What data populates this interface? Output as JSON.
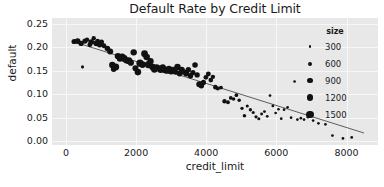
{
  "chart_data": {
    "type": "scatter",
    "title": "Default Rate by Credit Limit",
    "xlabel": "credit_limit",
    "ylabel": "default",
    "xlim": [
      -400,
      8900
    ],
    "ylim": [
      -0.008,
      0.262
    ],
    "xticks": [
      "0",
      "2000",
      "4000",
      "6000",
      "8000"
    ],
    "xtick_values": [
      0,
      2000,
      4000,
      6000,
      8000
    ],
    "yticks": [
      "0.00",
      "0.05",
      "0.10",
      "0.15",
      "0.20",
      "0.25"
    ],
    "ytick_values": [
      0.0,
      0.05,
      0.1,
      0.15,
      0.2,
      0.25
    ],
    "grid": true,
    "grid_color": "#f7f7f7",
    "plot_background": "#e8e8e8",
    "marker_color": "#111111",
    "trendline_color": "#4d4d4d",
    "legend": {
      "title": "size",
      "position": "upper right inside",
      "entries": [
        {
          "label": "300",
          "value": 300,
          "radius_px": 1.4
        },
        {
          "label": "600",
          "value": 600,
          "radius_px": 2.0
        },
        {
          "label": "900",
          "value": 900,
          "radius_px": 2.6
        },
        {
          "label": "1200",
          "value": 1200,
          "radius_px": 3.2
        },
        {
          "label": "1500",
          "value": 1500,
          "radius_px": 3.8
        }
      ]
    },
    "trendline": {
      "x0": 300,
      "y0": 0.2095,
      "x1": 8500,
      "y1": 0.0175
    },
    "size_encoding": {
      "column": "size",
      "min": 300,
      "max": 1500
    },
    "points": [
      {
        "x": 230,
        "y": 0.212,
        "size": 900
      },
      {
        "x": 330,
        "y": 0.213,
        "size": 1050
      },
      {
        "x": 430,
        "y": 0.208,
        "size": 900
      },
      {
        "x": 470,
        "y": 0.158,
        "size": 400
      },
      {
        "x": 540,
        "y": 0.213,
        "size": 900
      },
      {
        "x": 600,
        "y": 0.216,
        "size": 700
      },
      {
        "x": 680,
        "y": 0.205,
        "size": 850
      },
      {
        "x": 720,
        "y": 0.211,
        "size": 1000
      },
      {
        "x": 790,
        "y": 0.219,
        "size": 700
      },
      {
        "x": 860,
        "y": 0.208,
        "size": 1000
      },
      {
        "x": 900,
        "y": 0.213,
        "size": 800
      },
      {
        "x": 960,
        "y": 0.205,
        "size": 1000
      },
      {
        "x": 1010,
        "y": 0.211,
        "size": 900
      },
      {
        "x": 1080,
        "y": 0.203,
        "size": 850
      },
      {
        "x": 1180,
        "y": 0.197,
        "size": 1000
      },
      {
        "x": 1260,
        "y": 0.191,
        "size": 1100
      },
      {
        "x": 1320,
        "y": 0.162,
        "size": 1200
      },
      {
        "x": 1360,
        "y": 0.153,
        "size": 1000
      },
      {
        "x": 1420,
        "y": 0.158,
        "size": 1300
      },
      {
        "x": 1480,
        "y": 0.181,
        "size": 1200
      },
      {
        "x": 1540,
        "y": 0.176,
        "size": 1250
      },
      {
        "x": 1600,
        "y": 0.179,
        "size": 1400
      },
      {
        "x": 1660,
        "y": 0.176,
        "size": 1300
      },
      {
        "x": 1720,
        "y": 0.172,
        "size": 1200
      },
      {
        "x": 1790,
        "y": 0.171,
        "size": 1350
      },
      {
        "x": 1850,
        "y": 0.167,
        "size": 1150
      },
      {
        "x": 1930,
        "y": 0.189,
        "size": 1200
      },
      {
        "x": 1980,
        "y": 0.155,
        "size": 1100
      },
      {
        "x": 2050,
        "y": 0.147,
        "size": 1250
      },
      {
        "x": 2110,
        "y": 0.166,
        "size": 1400
      },
      {
        "x": 2180,
        "y": 0.163,
        "size": 1300
      },
      {
        "x": 2240,
        "y": 0.186,
        "size": 1300
      },
      {
        "x": 2300,
        "y": 0.179,
        "size": 1250
      },
      {
        "x": 2350,
        "y": 0.163,
        "size": 1400
      },
      {
        "x": 2410,
        "y": 0.17,
        "size": 1200
      },
      {
        "x": 2470,
        "y": 0.158,
        "size": 1250
      },
      {
        "x": 2520,
        "y": 0.153,
        "size": 1300
      },
      {
        "x": 2580,
        "y": 0.156,
        "size": 1350
      },
      {
        "x": 2640,
        "y": 0.155,
        "size": 1200
      },
      {
        "x": 2700,
        "y": 0.152,
        "size": 1250
      },
      {
        "x": 2760,
        "y": 0.157,
        "size": 1150
      },
      {
        "x": 2820,
        "y": 0.152,
        "size": 1300
      },
      {
        "x": 2880,
        "y": 0.15,
        "size": 1200
      },
      {
        "x": 2940,
        "y": 0.154,
        "size": 1100
      },
      {
        "x": 3000,
        "y": 0.149,
        "size": 1250
      },
      {
        "x": 3060,
        "y": 0.152,
        "size": 1150
      },
      {
        "x": 3120,
        "y": 0.147,
        "size": 1000
      },
      {
        "x": 3180,
        "y": 0.158,
        "size": 1200
      },
      {
        "x": 3240,
        "y": 0.144,
        "size": 1050
      },
      {
        "x": 3300,
        "y": 0.152,
        "size": 1150
      },
      {
        "x": 3360,
        "y": 0.147,
        "size": 1000
      },
      {
        "x": 3430,
        "y": 0.144,
        "size": 1100
      },
      {
        "x": 3490,
        "y": 0.152,
        "size": 950
      },
      {
        "x": 3550,
        "y": 0.139,
        "size": 1000
      },
      {
        "x": 3620,
        "y": 0.146,
        "size": 900
      },
      {
        "x": 3680,
        "y": 0.162,
        "size": 1000
      },
      {
        "x": 3740,
        "y": 0.141,
        "size": 950
      },
      {
        "x": 3800,
        "y": 0.121,
        "size": 1100
      },
      {
        "x": 3860,
        "y": 0.118,
        "size": 1000
      },
      {
        "x": 3920,
        "y": 0.125,
        "size": 900
      },
      {
        "x": 3990,
        "y": 0.136,
        "size": 800
      },
      {
        "x": 4060,
        "y": 0.143,
        "size": 850
      },
      {
        "x": 4130,
        "y": 0.13,
        "size": 800
      },
      {
        "x": 4190,
        "y": 0.137,
        "size": 700
      },
      {
        "x": 4260,
        "y": 0.115,
        "size": 750
      },
      {
        "x": 4330,
        "y": 0.112,
        "size": 650
      },
      {
        "x": 4420,
        "y": 0.114,
        "size": 600
      },
      {
        "x": 4520,
        "y": 0.085,
        "size": 700
      },
      {
        "x": 4620,
        "y": 0.083,
        "size": 600
      },
      {
        "x": 4700,
        "y": 0.092,
        "size": 550
      },
      {
        "x": 4780,
        "y": 0.09,
        "size": 500
      },
      {
        "x": 4860,
        "y": 0.098,
        "size": 550
      },
      {
        "x": 4940,
        "y": 0.087,
        "size": 500
      },
      {
        "x": 5020,
        "y": 0.07,
        "size": 450
      },
      {
        "x": 5090,
        "y": 0.054,
        "size": 500
      },
      {
        "x": 5170,
        "y": 0.075,
        "size": 400
      },
      {
        "x": 5260,
        "y": 0.067,
        "size": 450
      },
      {
        "x": 5340,
        "y": 0.061,
        "size": 400
      },
      {
        "x": 5420,
        "y": 0.052,
        "size": 420
      },
      {
        "x": 5500,
        "y": 0.048,
        "size": 380
      },
      {
        "x": 5580,
        "y": 0.058,
        "size": 350
      },
      {
        "x": 5660,
        "y": 0.063,
        "size": 330
      },
      {
        "x": 5740,
        "y": 0.053,
        "size": 320
      },
      {
        "x": 5820,
        "y": 0.097,
        "size": 300
      },
      {
        "x": 5900,
        "y": 0.075,
        "size": 310
      },
      {
        "x": 5980,
        "y": 0.06,
        "size": 300
      },
      {
        "x": 6060,
        "y": 0.068,
        "size": 300
      },
      {
        "x": 6140,
        "y": 0.048,
        "size": 300
      },
      {
        "x": 6220,
        "y": 0.067,
        "size": 300
      },
      {
        "x": 6320,
        "y": 0.072,
        "size": 300
      },
      {
        "x": 6420,
        "y": 0.05,
        "size": 300
      },
      {
        "x": 6520,
        "y": 0.127,
        "size": 300
      },
      {
        "x": 6600,
        "y": 0.046,
        "size": 300
      },
      {
        "x": 6700,
        "y": 0.049,
        "size": 300
      },
      {
        "x": 6790,
        "y": 0.046,
        "size": 300
      },
      {
        "x": 6900,
        "y": 0.051,
        "size": 300
      },
      {
        "x": 7050,
        "y": 0.044,
        "size": 300
      },
      {
        "x": 7200,
        "y": 0.038,
        "size": 300
      },
      {
        "x": 7400,
        "y": 0.036,
        "size": 300
      },
      {
        "x": 7600,
        "y": 0.012,
        "size": 300
      },
      {
        "x": 7900,
        "y": 0.006,
        "size": 300
      },
      {
        "x": 8150,
        "y": 0.008,
        "size": 300
      }
    ]
  }
}
